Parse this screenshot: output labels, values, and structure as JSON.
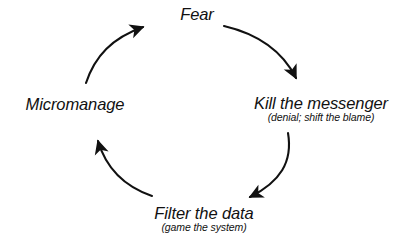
{
  "diagram": {
    "type": "cycle",
    "direction": "clockwise",
    "background_color": "#ffffff",
    "stroke_color": "#111111",
    "text_color": "#111111",
    "nodes": [
      {
        "id": "fear",
        "title": "Fear",
        "subtitle": "",
        "position": "top",
        "order": 1
      },
      {
        "id": "kill-the-messenger",
        "title": "Kill the messenger",
        "subtitle": "(denial; shift the blame)",
        "position": "right",
        "order": 2
      },
      {
        "id": "filter-the-data",
        "title": "Filter the data",
        "subtitle": "(game the system)",
        "position": "bottom",
        "order": 3
      },
      {
        "id": "micromanage",
        "title": "Micromanage",
        "subtitle": "",
        "position": "left",
        "order": 4
      }
    ],
    "edges": [
      {
        "id": "fear-to-kill",
        "from": "fear",
        "to": "kill-the-messenger",
        "arc": "top-right"
      },
      {
        "id": "kill-to-filter",
        "from": "kill-the-messenger",
        "to": "filter-the-data",
        "arc": "bottom-right"
      },
      {
        "id": "filter-to-micro",
        "from": "filter-the-data",
        "to": "micromanage",
        "arc": "bottom-left"
      },
      {
        "id": "micro-to-fear",
        "from": "micromanage",
        "to": "fear",
        "arc": "top-left"
      }
    ]
  }
}
